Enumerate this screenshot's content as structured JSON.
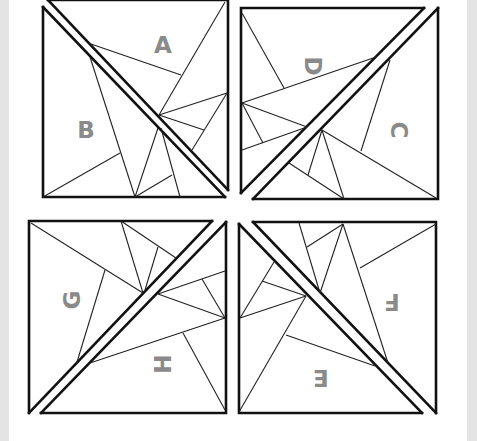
{
  "diagram": {
    "type": "paper-piecing-pattern",
    "colors": {
      "line": "#111111",
      "label": "#8a8a8a",
      "background": "#ffffff",
      "edge_strip": "#e4e4e4"
    },
    "blocks": [
      {
        "id": "top-left",
        "pieces": [
          {
            "label": "A",
            "x": 163,
            "y": 45,
            "rotate": 0
          },
          {
            "label": "B",
            "x": 86,
            "y": 130,
            "rotate": 0
          }
        ]
      },
      {
        "id": "top-right",
        "pieces": [
          {
            "label": "D",
            "x": 313,
            "y": 66,
            "rotate": 90
          },
          {
            "label": "C",
            "x": 399,
            "y": 130,
            "rotate": 90
          }
        ]
      },
      {
        "id": "bottom-left",
        "pieces": [
          {
            "label": "G",
            "x": 72,
            "y": 300,
            "rotate": -90
          },
          {
            "label": "H",
            "x": 163,
            "y": 364,
            "rotate": -90
          }
        ]
      },
      {
        "id": "bottom-right",
        "pieces": [
          {
            "label": "F",
            "x": 392,
            "y": 302,
            "rotate": 180
          },
          {
            "label": "E",
            "x": 321,
            "y": 378,
            "rotate": 180
          }
        ]
      }
    ]
  }
}
